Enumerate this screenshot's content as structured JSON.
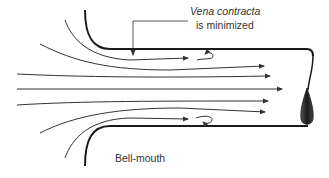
{
  "diagram": {
    "labels": {
      "vena_contracta_line1": "Vena contracta",
      "vena_contracta_line2": "is minimized",
      "bell_mouth": "Bell-mouth"
    },
    "colors": {
      "wall": "#1a1a1a",
      "streamline": "#333333",
      "text": "#333333",
      "drop": "#2a2a2a"
    },
    "elements": {
      "streamline_count": 7,
      "recirculation_eddies": 2,
      "exit_drop": 1
    }
  }
}
